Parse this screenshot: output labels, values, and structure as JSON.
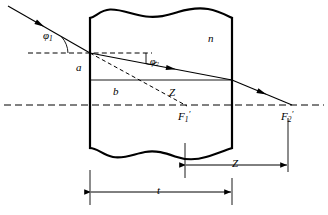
{
  "figure": {
    "kind": "optical-ray-diagram",
    "stroke_color": "#000000",
    "background_color": "#ffffff"
  },
  "labels": {
    "angle_incidence": {
      "base": "φ",
      "sub": "1",
      "prime": ""
    },
    "angle_refraction": {
      "base": "φ",
      "sub": "2",
      "prime": ""
    },
    "refractive_index": {
      "base": "n",
      "sub": "",
      "prime": ""
    },
    "ray_height_a": {
      "base": "a",
      "sub": "",
      "prime": ""
    },
    "ray_height_b": {
      "base": "b",
      "sub": "",
      "prime": ""
    },
    "shift_inner": {
      "base": "Z",
      "sub": "",
      "prime": ""
    },
    "shift_dimension": {
      "base": "Z",
      "sub": "",
      "prime": ""
    },
    "thickness_dimension": {
      "base": "t",
      "sub": "",
      "prime": ""
    },
    "focus_first": {
      "base": "F",
      "sub": "1",
      "prime": "′"
    },
    "focus_second": {
      "base": "F",
      "sub": "2",
      "prime": "′"
    }
  },
  "geometry": {
    "plate_left_x": 90,
    "plate_right_x": 232,
    "plate_top_y": 18,
    "plate_bottom_y": 148,
    "optical_axis_y": 105,
    "reference_line_y": 53,
    "entry_point_x": 90,
    "entry_point_y": 53,
    "exit_point_x": 232,
    "exit_point_y": 80,
    "focus_first_x": 185,
    "focus_second_x": 288,
    "thickness_dim_y": 192,
    "shift_dim_y": 165
  }
}
